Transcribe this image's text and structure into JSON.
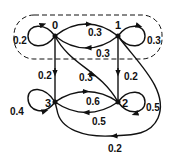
{
  "diagram": {
    "type": "markov-chain-state-graph",
    "group_box": {
      "style": "dashed",
      "contains": [
        "0",
        "1"
      ]
    },
    "nodes": [
      {
        "id": "0",
        "label": "0"
      },
      {
        "id": "1",
        "label": "1"
      },
      {
        "id": "2",
        "label": "2"
      },
      {
        "id": "3",
        "label": "3"
      }
    ],
    "edges": [
      {
        "from": "0",
        "to": "0",
        "label": "0.2"
      },
      {
        "from": "0",
        "to": "1",
        "label": "0.3"
      },
      {
        "from": "1",
        "to": "0",
        "label": "0.3"
      },
      {
        "from": "1",
        "to": "1",
        "label": "0.3"
      },
      {
        "from": "0",
        "to": "3",
        "label": "0.2"
      },
      {
        "from": "0",
        "to": "2",
        "label": "0.3"
      },
      {
        "from": "1",
        "to": "2",
        "label": "0.2"
      },
      {
        "from": "1",
        "to": "3",
        "label": "0.2"
      },
      {
        "from": "3",
        "to": "2",
        "label": "0.6"
      },
      {
        "from": "2",
        "to": "3",
        "label": "0.5"
      },
      {
        "from": "3",
        "to": "3",
        "label": "0.4"
      },
      {
        "from": "2",
        "to": "2",
        "label": "0.5"
      }
    ]
  }
}
